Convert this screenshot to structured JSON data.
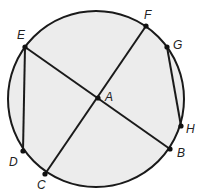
{
  "diagram": {
    "type": "circle-chords",
    "circle": {
      "cx": 96,
      "cy": 99,
      "r": 88,
      "fill": "#ececec",
      "stroke": "#1a1a1a"
    },
    "center_point": "A",
    "points": [
      {
        "id": "A",
        "label": "A",
        "x": 98,
        "y": 98,
        "lx": 105,
        "ly": 101
      },
      {
        "id": "B",
        "label": "B",
        "x": 170,
        "y": 149,
        "lx": 177,
        "ly": 157
      },
      {
        "id": "C",
        "label": "C",
        "x": 45,
        "y": 174,
        "lx": 37,
        "ly": 189
      },
      {
        "id": "D",
        "label": "D",
        "x": 23,
        "y": 151,
        "lx": 9,
        "ly": 166
      },
      {
        "id": "E",
        "label": "E",
        "x": 25,
        "y": 47,
        "lx": 17,
        "ly": 39
      },
      {
        "id": "F",
        "label": "F",
        "x": 146,
        "y": 26,
        "lx": 144,
        "ly": 19
      },
      {
        "id": "G",
        "label": "G",
        "x": 167,
        "y": 47,
        "lx": 173,
        "ly": 49
      },
      {
        "id": "H",
        "label": "H",
        "x": 181,
        "y": 126,
        "lx": 186,
        "ly": 133
      }
    ],
    "segments": [
      {
        "from": "E",
        "to": "B"
      },
      {
        "from": "F",
        "to": "C"
      },
      {
        "from": "E",
        "to": "D"
      },
      {
        "from": "G",
        "to": "H"
      }
    ]
  }
}
